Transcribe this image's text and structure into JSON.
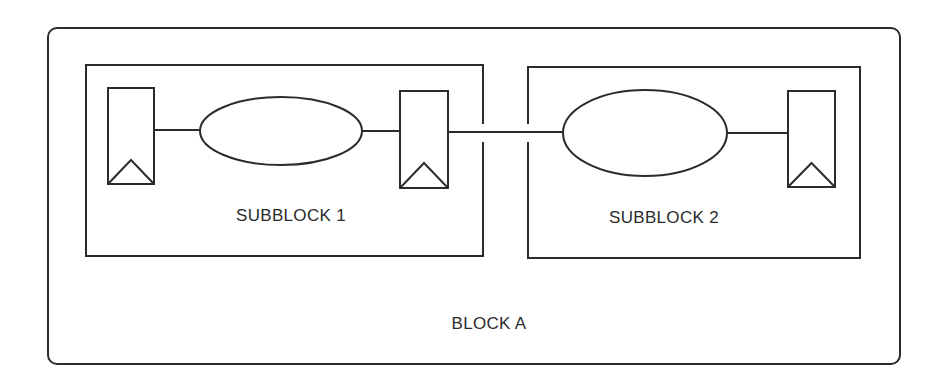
{
  "diagram": {
    "type": "hierarchical-block-diagram",
    "stroke_color": "#2b2b2b",
    "background": "#ffffff",
    "outer_block": {
      "label": "BLOCK A",
      "x": 48,
      "y": 28,
      "w": 852,
      "h": 336,
      "radius": 9,
      "label_pos": [
        489,
        324
      ]
    },
    "subblocks": [
      {
        "id": "subblock-1",
        "label": "SUBBLOCK 1",
        "x": 86,
        "y": 65,
        "w": 397,
        "h": 191,
        "label_pos": [
          291,
          216
        ]
      },
      {
        "id": "subblock-2",
        "label": "SUBBLOCK 2",
        "x": 528,
        "y": 67,
        "w": 332,
        "h": 191,
        "label_pos": [
          664,
          218
        ]
      }
    ],
    "flip_flops": [
      {
        "id": "ff-1",
        "x": 108,
        "y": 88,
        "w": 46,
        "h": 96,
        "clock_apex_y": 160
      },
      {
        "id": "ff-2",
        "x": 400,
        "y": 91,
        "w": 48,
        "h": 97,
        "clock_apex_y": 163
      },
      {
        "id": "ff-3",
        "x": 788,
        "y": 91,
        "w": 47,
        "h": 96,
        "clock_apex_y": 163
      }
    ],
    "logic_clouds": [
      {
        "id": "logic-1",
        "cx": 281,
        "cy": 131,
        "rx": 81,
        "ry": 34
      },
      {
        "id": "logic-2",
        "cx": 645,
        "cy": 133,
        "rx": 82,
        "ry": 43
      }
    ],
    "wires": [
      {
        "id": "ff1-to-logic1",
        "x1": 154,
        "y1": 130,
        "x2": 200,
        "y2": 130
      },
      {
        "id": "logic1-to-ff2",
        "x1": 362,
        "y1": 131,
        "x2": 400,
        "y2": 131
      },
      {
        "id": "ff2-to-logic2",
        "x1": 448,
        "y1": 132,
        "x2": 563,
        "y2": 132
      },
      {
        "id": "logic2-to-ff3",
        "x1": 727,
        "y1": 133,
        "x2": 788,
        "y2": 133
      }
    ],
    "boundary_gaps": [
      {
        "subblock": "subblock-1",
        "side": "right",
        "y_from": 124,
        "y_to": 142
      },
      {
        "subblock": "subblock-2",
        "side": "left",
        "y_from": 124,
        "y_to": 142
      }
    ]
  }
}
